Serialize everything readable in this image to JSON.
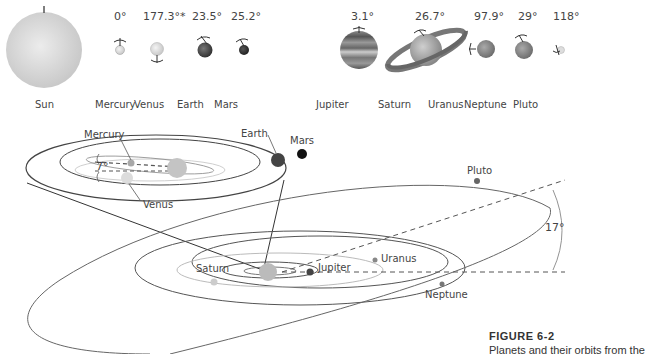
{
  "figure": {
    "number_label": "FIGURE 6-2",
    "caption_visible": "Planets and their orbits from the"
  },
  "planets_row": [
    {
      "name": "Sun",
      "tilt": ""
    },
    {
      "name": "Mercury",
      "tilt": "0°"
    },
    {
      "name": "Venus",
      "tilt": "177.3°*"
    },
    {
      "name": "Earth",
      "tilt": "23.5°"
    },
    {
      "name": "Mars",
      "tilt": "25.2°"
    },
    {
      "name": "Jupiter",
      "tilt": "3.1°"
    },
    {
      "name": "Saturn",
      "tilt": "26.7°"
    },
    {
      "name": "Uranus",
      "tilt": "97.9°"
    },
    {
      "name": "Neptune",
      "tilt": "29°"
    },
    {
      "name": "Pluto",
      "tilt": "118°"
    }
  ],
  "inner_orbits": {
    "labels": {
      "mercury": "Mercury",
      "venus": "Venus",
      "earth": "Earth",
      "mars": "Mars"
    },
    "inclination_label": "7°"
  },
  "outer_orbits": {
    "labels": {
      "saturn": "Saturn",
      "jupiter": "Jupiter",
      "uranus": "Uranus",
      "neptune": "Neptune",
      "pluto": "Pluto"
    },
    "inclination_label": "17°"
  },
  "colors": {
    "sun": "#d4d4d4",
    "mercury": "#b8b8b8",
    "venus": "#e0e0e0",
    "earth": "#555555",
    "mars": "#222222",
    "jupiter": "#666666",
    "uranus": "#888888",
    "neptune": "#888888",
    "pluto": "#777777",
    "orbit_line": "#555555",
    "orbit_light": "#c8c8c8"
  }
}
